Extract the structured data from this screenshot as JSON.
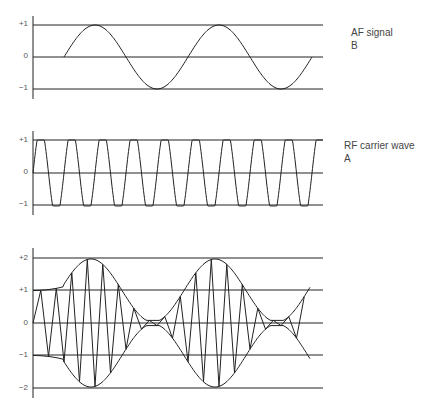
{
  "panels": [
    {
      "id": "af",
      "title": "AF signal",
      "letter": "B",
      "ticks": [
        "+1",
        "0",
        "−1"
      ]
    },
    {
      "id": "rf",
      "title": "RF carrier wave",
      "letter": "A",
      "ticks": [
        "+1",
        "0",
        "−1"
      ]
    },
    {
      "id": "am",
      "title": "",
      "letter": "",
      "ticks": [
        "+2",
        "+1",
        "0",
        "−1",
        "−2"
      ]
    }
  ],
  "colors": {
    "line": "#222222",
    "grid": "#333333",
    "text": "#444444"
  }
}
